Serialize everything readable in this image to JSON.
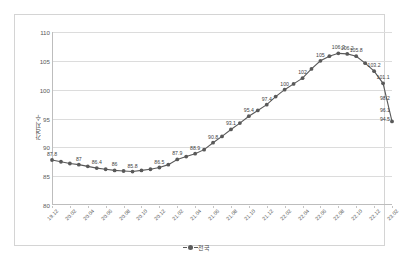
{
  "chart_data": {
    "type": "line",
    "title": "",
    "xlabel": "",
    "ylabel": "가격지수",
    "ylim": [
      80,
      110
    ],
    "yticks": [
      110,
      105,
      100,
      95,
      90,
      85,
      80
    ],
    "grid": true,
    "legend_position": "bottom",
    "legend": [
      "전국"
    ],
    "series_color": "#595959",
    "marker_color": "#595959",
    "categories": [
      "19.12",
      "20.01",
      "20.02",
      "20.03",
      "20.04",
      "20.05",
      "20.06",
      "20.07",
      "20.08",
      "20.09",
      "20.10",
      "20.11",
      "20.12",
      "21.01",
      "21.02",
      "21.03",
      "21.04",
      "21.05",
      "21.06",
      "21.07",
      "21.08",
      "21.09",
      "21.10",
      "21.11",
      "21.12",
      "22.01",
      "22.02",
      "22.03",
      "22.04",
      "22.05",
      "22.06",
      "22.07",
      "22.08",
      "22.09",
      "22.10",
      "22.11",
      "22.12",
      "23.01",
      "23.02"
    ],
    "xtick_labels": [
      "19.12",
      "20.02",
      "20.04",
      "20.06",
      "20.08",
      "20.10",
      "20.12",
      "21.02",
      "21.04",
      "21.06",
      "21.08",
      "21.10",
      "21.12",
      "22.02",
      "22.04",
      "22.06",
      "22.08",
      "22.10",
      "22.12",
      "23.02"
    ],
    "series": [
      {
        "name": "전국",
        "values": [
          87.8,
          87.5,
          87.2,
          87.0,
          86.7,
          86.4,
          86.2,
          86.0,
          85.9,
          85.8,
          86.0,
          86.2,
          86.5,
          87.0,
          87.9,
          88.4,
          88.9,
          89.6,
          90.8,
          91.9,
          93.1,
          94.2,
          95.4,
          96.4,
          97.4,
          98.8,
          100.0,
          101.0,
          102.0,
          103.6,
          105.0,
          105.8,
          106.3,
          106.2,
          105.8,
          104.6,
          103.2,
          101.1,
          94.5
        ]
      }
    ],
    "point_labels": [
      {
        "index": 0,
        "value": 87.8,
        "text": "87.8"
      },
      {
        "index": 3,
        "value": 87.0,
        "text": "87"
      },
      {
        "index": 5,
        "value": 86.4,
        "text": "86.4"
      },
      {
        "index": 7,
        "value": 86.0,
        "text": "86"
      },
      {
        "index": 9,
        "value": 85.8,
        "text": "85.8"
      },
      {
        "index": 12,
        "value": 86.5,
        "text": "86.5"
      },
      {
        "index": 14,
        "value": 87.9,
        "text": "87.9"
      },
      {
        "index": 16,
        "value": 88.9,
        "text": "88.9"
      },
      {
        "index": 18,
        "value": 90.8,
        "text": "90.8"
      },
      {
        "index": 20,
        "value": 93.1,
        "text": "93.1"
      },
      {
        "index": 22,
        "value": 95.4,
        "text": "95.4"
      },
      {
        "index": 24,
        "value": 97.4,
        "text": "97.4"
      },
      {
        "index": 26,
        "value": 100.0,
        "text": "100"
      },
      {
        "index": 28,
        "value": 102.0,
        "text": "102"
      },
      {
        "index": 30,
        "value": 105.0,
        "text": "105"
      },
      {
        "index": 32,
        "value": 106.3,
        "text": "106.3"
      },
      {
        "index": 33,
        "value": 106.2,
        "text": "106.2"
      },
      {
        "index": 34,
        "value": 105.8,
        "text": "105.8"
      },
      {
        "index": 36,
        "value": 103.2,
        "text": "103.2"
      },
      {
        "index": 37,
        "value": 101.1,
        "text": "101.1"
      },
      {
        "index": 38,
        "value": 98.2,
        "text": "98.2"
      },
      {
        "index": 38,
        "value": 96.1,
        "text": "96.1"
      },
      {
        "index": 38,
        "value": 94.5,
        "text": "94.5"
      }
    ],
    "tail_labels": [
      "98.2",
      "96.1",
      "94.5"
    ]
  }
}
